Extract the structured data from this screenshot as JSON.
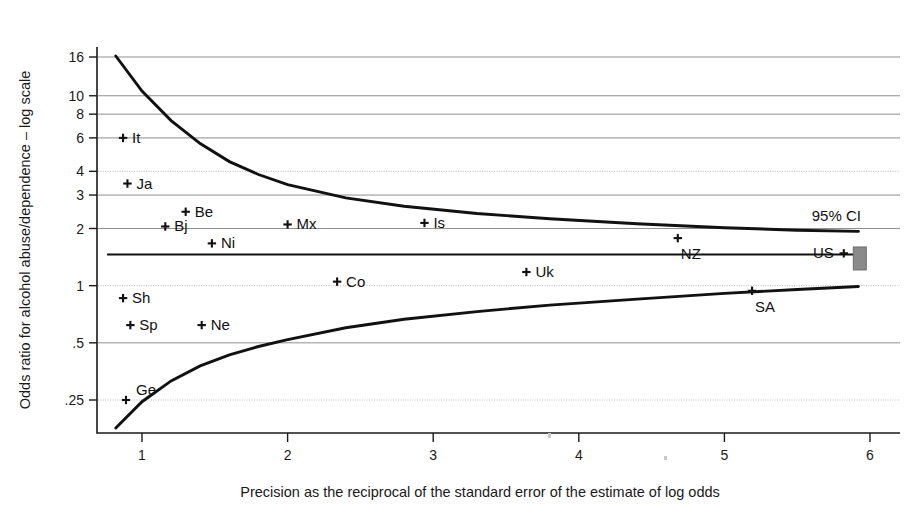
{
  "chart_data": {
    "type": "scatter",
    "title": "",
    "subtitle": "",
    "xlabel": "Precision as the reciprocal of the standard error of the estimate of log odds",
    "ylabel": "Odds ratio for alcohol abuse/dependence – log scale",
    "xlim": [
      0.72,
      6.05
    ],
    "ylim": [
      0.16,
      17.5
    ],
    "y_scale": "log",
    "grid": true,
    "legend_position": "none",
    "xticks": [
      1,
      2,
      3,
      4,
      5,
      6
    ],
    "xtick_labels": [
      "1",
      "2",
      "3",
      "4",
      "5",
      "6"
    ],
    "yticks": [
      0.25,
      0.5,
      1,
      2,
      3,
      4,
      6,
      8,
      10,
      16
    ],
    "ytick_labels": [
      ".25",
      ".5",
      "1",
      "2",
      "3",
      "4",
      "6",
      "8",
      "10",
      "16"
    ],
    "annotations": [
      {
        "text": "95% CI",
        "x": 5.6,
        "y": 2.18
      }
    ],
    "pooled_estimate": {
      "label": "pooled-estimate-line",
      "y": 1.46,
      "x_start": 0.76,
      "x_end": 5.92
    },
    "funnel_bounds": {
      "description": "95% confidence funnel about the pooled estimate",
      "upper": [
        {
          "x": 0.82,
          "y": 16.2
        },
        {
          "x": 1.0,
          "y": 10.6
        },
        {
          "x": 1.2,
          "y": 7.4
        },
        {
          "x": 1.4,
          "y": 5.6
        },
        {
          "x": 1.6,
          "y": 4.5
        },
        {
          "x": 1.8,
          "y": 3.85
        },
        {
          "x": 2.0,
          "y": 3.4
        },
        {
          "x": 2.4,
          "y": 2.9
        },
        {
          "x": 2.8,
          "y": 2.62
        },
        {
          "x": 3.3,
          "y": 2.4
        },
        {
          "x": 3.8,
          "y": 2.25
        },
        {
          "x": 4.4,
          "y": 2.12
        },
        {
          "x": 5.0,
          "y": 2.02
        },
        {
          "x": 5.5,
          "y": 1.96
        },
        {
          "x": 5.92,
          "y": 1.93
        }
      ],
      "lower": [
        {
          "x": 0.82,
          "y": 0.178
        },
        {
          "x": 1.0,
          "y": 0.245
        },
        {
          "x": 1.2,
          "y": 0.315
        },
        {
          "x": 1.4,
          "y": 0.378
        },
        {
          "x": 1.6,
          "y": 0.432
        },
        {
          "x": 1.8,
          "y": 0.478
        },
        {
          "x": 2.0,
          "y": 0.52
        },
        {
          "x": 2.4,
          "y": 0.6
        },
        {
          "x": 2.8,
          "y": 0.665
        },
        {
          "x": 3.3,
          "y": 0.73
        },
        {
          "x": 3.8,
          "y": 0.79
        },
        {
          "x": 4.4,
          "y": 0.85
        },
        {
          "x": 5.0,
          "y": 0.91
        },
        {
          "x": 5.5,
          "y": 0.955
        },
        {
          "x": 5.92,
          "y": 0.99
        }
      ]
    },
    "points": [
      {
        "label": "It",
        "x": 0.87,
        "y": 6.0,
        "label_side": "right"
      },
      {
        "label": "Ja",
        "x": 0.9,
        "y": 3.45,
        "label_side": "right"
      },
      {
        "label": "Be",
        "x": 1.3,
        "y": 2.45,
        "label_side": "right"
      },
      {
        "label": "Bj",
        "x": 1.16,
        "y": 2.05,
        "label_side": "right"
      },
      {
        "label": "Ni",
        "x": 1.48,
        "y": 1.67,
        "label_side": "right"
      },
      {
        "label": "Mx",
        "x": 2.0,
        "y": 2.1,
        "label_side": "right"
      },
      {
        "label": "Is",
        "x": 2.94,
        "y": 2.14,
        "label_side": "right"
      },
      {
        "label": "NZ",
        "x": 4.68,
        "y": 1.78,
        "label_side": "below-right"
      },
      {
        "label": "US",
        "x": 5.82,
        "y": 1.48,
        "label_side": "left"
      },
      {
        "label": "Uk",
        "x": 3.64,
        "y": 1.18,
        "label_side": "right"
      },
      {
        "label": "Co",
        "x": 2.34,
        "y": 1.05,
        "label_side": "right"
      },
      {
        "label": "Sh",
        "x": 0.87,
        "y": 0.86,
        "label_side": "right"
      },
      {
        "label": "SA",
        "x": 5.19,
        "y": 0.94,
        "label_side": "below-right"
      },
      {
        "label": "Sp",
        "x": 0.92,
        "y": 0.62,
        "label_side": "right"
      },
      {
        "label": "Ne",
        "x": 1.41,
        "y": 0.62,
        "label_side": "right"
      },
      {
        "label": "Ge",
        "x": 0.89,
        "y": 0.25,
        "label_side": "above-right"
      }
    ],
    "us_weight_box": {
      "label": "US study weight box",
      "x": 5.93,
      "y": 1.46,
      "color": "#8a8a8a"
    }
  },
  "colors": {
    "ink": "#111111",
    "grid": "#8f8f8f",
    "grid_faint": "#bdbdbd",
    "box": "#8a8a8a",
    "background": "#ffffff"
  }
}
